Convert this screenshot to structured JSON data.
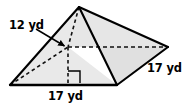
{
  "figure": {
    "name": "square-pyramid-diagram",
    "shape": "square pyramid",
    "unit": "yd",
    "colors": {
      "background": "#ffffff",
      "face_fill_light": "#ededed",
      "face_fill_mid": "#e4e4e4",
      "face_fill_dark": "#dcdcdc",
      "outline": "#000000",
      "hidden_edge": "#1a1a1a",
      "text": "#000000"
    },
    "labels": {
      "height": "12 yd",
      "slant_right": "17 yd",
      "base_front": "17 yd"
    },
    "annotations": {
      "right_angle_marker": "right-angle",
      "leader_arrow": "height-leader-arrow"
    },
    "geometry": {
      "apex": [
        79,
        7
      ],
      "base_front_left": [
        10,
        85
      ],
      "base_front_right": [
        117,
        85
      ],
      "base_far_right": [
        168,
        47
      ],
      "base_hidden_back": [
        68,
        47
      ],
      "height_foot": [
        68,
        82
      ]
    }
  }
}
